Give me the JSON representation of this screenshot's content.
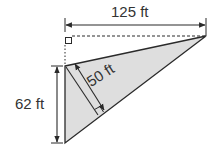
{
  "diagram": {
    "type": "triangle-area-figure",
    "fill_color": "#dedede",
    "stroke_color": "#2a2a2a",
    "labels": {
      "top_width": "125 ft",
      "altitude": "50 ft",
      "left_side": "62 ft"
    },
    "marks": [
      "right-angle-top-left",
      "right-angle-altitude-foot"
    ]
  }
}
